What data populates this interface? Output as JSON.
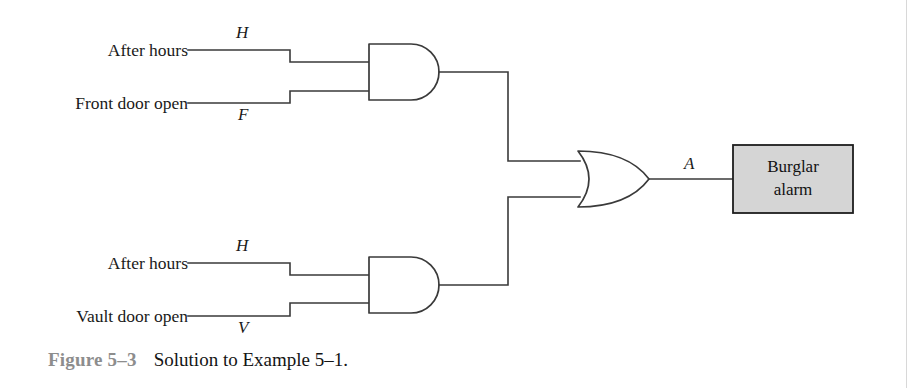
{
  "figure": {
    "number": "Figure 5–3",
    "caption": "Solution to Example 5–1.",
    "type": "logic-circuit-diagram"
  },
  "colors": {
    "wire": "#3a3a3a",
    "gate_outline": "#3a3a3a",
    "output_box_fill": "#d5d5d5",
    "output_box_border": "#1d1d1d",
    "caption_number": "#8d8d8d",
    "caption_text": "#141414",
    "background": "#ffffff"
  },
  "inputs": [
    {
      "label": "After hours",
      "signal": "H",
      "signal_position": "above",
      "gate": "and-gate-top",
      "pin": "top"
    },
    {
      "label": "Front door open",
      "signal": "F",
      "signal_position": "below",
      "gate": "and-gate-top",
      "pin": "bottom"
    },
    {
      "label": "After hours",
      "signal": "H",
      "signal_position": "above",
      "gate": "and-gate-bottom",
      "pin": "top"
    },
    {
      "label": "Vault door open",
      "signal": "V",
      "signal_position": "below",
      "gate": "and-gate-bottom",
      "pin": "bottom"
    }
  ],
  "gates": [
    {
      "name": "and-gate-top",
      "type": "AND",
      "inputs": [
        "H",
        "F"
      ]
    },
    {
      "name": "and-gate-bottom",
      "type": "AND",
      "inputs": [
        "H",
        "V"
      ]
    },
    {
      "name": "or-gate",
      "type": "OR",
      "inputs": [
        "and-gate-top",
        "and-gate-bottom"
      ]
    }
  ],
  "output": {
    "signal": "A",
    "box_line1": "Burglar",
    "box_line2": "alarm"
  }
}
